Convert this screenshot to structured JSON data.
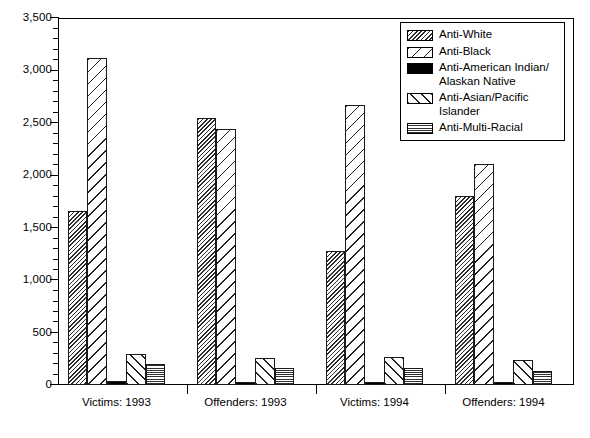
{
  "chart_data": {
    "type": "bar",
    "title": "",
    "subtitle": "",
    "xlabel": "",
    "ylabel": "",
    "grid": false,
    "legend_position": "top-right",
    "ylim": [
      0,
      3500
    ],
    "ytick_labels": [
      "0",
      "500",
      "1,000",
      "1,500",
      "2,000",
      "2,500",
      "3,000",
      "3,500"
    ],
    "ytick_values": [
      0,
      500,
      1000,
      1500,
      2000,
      2500,
      3000,
      3500
    ],
    "minor_tick_interval": 100,
    "categories": [
      "Victims: 1993",
      "Offenders: 1993",
      "Victims: 1994",
      "Offenders: 1994"
    ],
    "series": [
      {
        "name": "Anti-White",
        "pattern": "dense-diagonal-hatch",
        "values": [
          1655,
          2550,
          1280,
          1800
        ]
      },
      {
        "name": "Anti-Black",
        "pattern": "sparse-forward-diagonal",
        "values": [
          3120,
          2440,
          2670,
          2110
        ]
      },
      {
        "name": "Anti-American Indian/\nAlaskan Native",
        "pattern": "solid-black",
        "values": [
          40,
          30,
          25,
          25
        ]
      },
      {
        "name": "Anti-Asian/Pacific Islander",
        "pattern": "sparse-back-diagonal",
        "values": [
          300,
          260,
          270,
          240
        ]
      },
      {
        "name": "Anti-Multi-Racial",
        "pattern": "fine-cross-dots",
        "values": [
          205,
          160,
          160,
          130
        ]
      }
    ]
  },
  "legend": {
    "items": [
      {
        "label": "Anti-White",
        "pattern": "dense-diagonal-hatch"
      },
      {
        "label": "Anti-Black",
        "pattern": "sparse-forward-diagonal"
      },
      {
        "label": "Anti-American Indian/\nAlaskan Native",
        "pattern": "solid-black"
      },
      {
        "label": "Anti-Asian/Pacific Islander",
        "pattern": "sparse-back-diagonal"
      },
      {
        "label": "Anti-Multi-Racial",
        "pattern": "fine-cross-dots"
      }
    ]
  }
}
